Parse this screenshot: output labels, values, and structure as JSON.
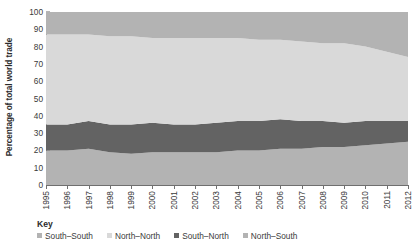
{
  "chart_data": {
    "type": "area",
    "stacked": true,
    "title": "",
    "subtitle": "",
    "xlabel": "",
    "ylabel": "Percentage of total world trade",
    "ylim": [
      0,
      100
    ],
    "yticks": [
      0,
      10,
      20,
      30,
      40,
      50,
      60,
      70,
      80,
      90,
      100
    ],
    "grid": false,
    "legend_position": "bottom",
    "legend_title": "Key",
    "x": [
      1995,
      1996,
      1997,
      1998,
      1999,
      2000,
      2001,
      2002,
      2003,
      2004,
      2005,
      2006,
      2007,
      2008,
      2009,
      2010,
      2011,
      2012
    ],
    "categories": [
      "1995",
      "1996",
      "1997",
      "1998",
      "1999",
      "2000",
      "2001",
      "2002",
      "2003",
      "2004",
      "2005",
      "2006",
      "2007",
      "2008",
      "2009",
      "2010",
      "2011",
      "2012"
    ],
    "stack_order_bottom_to_top": [
      "South–South",
      "South–North",
      "North–North",
      "North–South"
    ],
    "series": [
      {
        "name": "South–South",
        "color": "#b3b3b3",
        "values": [
          20,
          20,
          21,
          19,
          18,
          19,
          19,
          19,
          19,
          20,
          20,
          21,
          21,
          22,
          22,
          23,
          24,
          25
        ]
      },
      {
        "name": "South–North",
        "color": "#636363",
        "values": [
          15,
          15,
          16,
          16,
          17,
          17,
          16,
          16,
          17,
          17,
          17,
          17,
          16,
          15,
          14,
          14,
          13,
          12
        ]
      },
      {
        "name": "North–North",
        "color": "#d9d9d9",
        "values": [
          52,
          52,
          50,
          51,
          51,
          49,
          50,
          50,
          49,
          48,
          47,
          46,
          46,
          45,
          46,
          43,
          40,
          37
        ]
      },
      {
        "name": "North–South",
        "color": "#b3b3b3",
        "values": [
          13,
          13,
          13,
          14,
          14,
          15,
          15,
          15,
          15,
          15,
          16,
          16,
          17,
          18,
          18,
          20,
          23,
          26
        ]
      }
    ],
    "cumulative_top_boundaries": {
      "South–South": [
        20,
        20,
        21,
        19,
        18,
        19,
        19,
        19,
        19,
        20,
        20,
        21,
        21,
        22,
        22,
        23,
        24,
        25
      ],
      "South–North": [
        35,
        35,
        37,
        35,
        35,
        36,
        35,
        35,
        36,
        37,
        37,
        38,
        37,
        37,
        36,
        37,
        37,
        37
      ],
      "North–North": [
        87,
        87,
        87,
        86,
        86,
        85,
        85,
        85,
        85,
        85,
        84,
        84,
        83,
        82,
        82,
        80,
        77,
        74
      ],
      "North–South": [
        100,
        100,
        100,
        100,
        100,
        100,
        100,
        100,
        100,
        100,
        100,
        100,
        100,
        100,
        100,
        100,
        100,
        100
      ]
    }
  },
  "legend": {
    "title": "Key",
    "items": [
      {
        "label": "South–South",
        "color": "#b3b3b3"
      },
      {
        "label": "North–North",
        "color": "#d9d9d9"
      },
      {
        "label": "South–North",
        "color": "#636363"
      },
      {
        "label": "North–South",
        "color": "#b3b3b3"
      }
    ]
  },
  "axes": {
    "y_title": "Percentage of total world trade"
  },
  "colors": {
    "south_south": "#b3b3b3",
    "north_north": "#d9d9d9",
    "south_north": "#636363",
    "north_south": "#b3b3b3",
    "axis": "#6f6f6f",
    "text": "#3a3a3a",
    "background": "#ffffff"
  }
}
